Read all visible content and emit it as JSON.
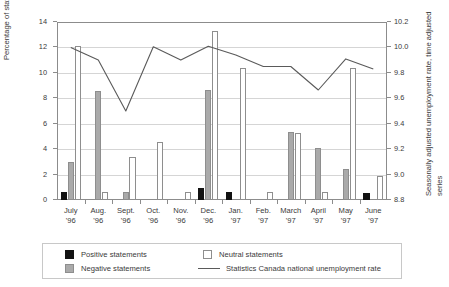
{
  "chart_data": {
    "type": "bar",
    "title": "",
    "xlabel": "",
    "ylabel": "Percentage of statements about unemployment",
    "y2label": "Seasonally adjusted unemployment rate, time adjusted series",
    "ylim": [
      0,
      14
    ],
    "y2lim": [
      8.8,
      10.2
    ],
    "grid": true,
    "legend_position": "bottom",
    "categories": [
      "July\n'96",
      "Aug.\n'96",
      "Sept.\n'96",
      "Oct.\n'96",
      "Nov.\n'96",
      "Dec.\n'96",
      "Jan.\n'97",
      "Feb.\n'97",
      "March\n'97",
      "April\n'97",
      "May\n'97",
      "June\n'97"
    ],
    "category_labels": [
      {
        "month": "July",
        "year": "'96"
      },
      {
        "month": "Aug.",
        "year": "'96"
      },
      {
        "month": "Sept.",
        "year": "'96"
      },
      {
        "month": "Oct.",
        "year": "'96"
      },
      {
        "month": "Nov.",
        "year": "'96"
      },
      {
        "month": "Dec.",
        "year": "'96"
      },
      {
        "month": "Jan.",
        "year": "'97"
      },
      {
        "month": "Feb.",
        "year": "'97"
      },
      {
        "month": "March",
        "year": "'97"
      },
      {
        "month": "April",
        "year": "'97"
      },
      {
        "month": "May",
        "year": "'97"
      },
      {
        "month": "June",
        "year": "'97"
      }
    ],
    "ytick_labels": [
      "0",
      "2",
      "4",
      "6",
      "8",
      "10",
      "12",
      "14"
    ],
    "ytick_values": [
      0,
      2,
      4,
      6,
      8,
      10,
      12,
      14
    ],
    "y2tick_labels": [
      "8.8",
      "9.0",
      "9.2",
      "9.4",
      "9.6",
      "9.8",
      "10.0",
      "10.2"
    ],
    "y2tick_values": [
      8.8,
      9.0,
      9.2,
      9.4,
      9.6,
      9.8,
      10.0,
      10.2
    ],
    "series": [
      {
        "name": "Positive statements",
        "kind": "bar",
        "color": "#121212",
        "axis": "left",
        "values": [
          0.6,
          0,
          0,
          0,
          0,
          0.95,
          0.6,
          0,
          0,
          0,
          0,
          0.55
        ]
      },
      {
        "name": "Negative statements",
        "kind": "bar",
        "color": "#aaaaaa",
        "axis": "left",
        "values": [
          3.0,
          8.6,
          0.65,
          0,
          0,
          8.65,
          0,
          0,
          5.35,
          4.1,
          2.45,
          0
        ]
      },
      {
        "name": "Neutral statements",
        "kind": "bar",
        "color": "#ffffff",
        "axis": "left",
        "values": [
          12.1,
          0.65,
          3.4,
          4.6,
          0.65,
          13.3,
          10.4,
          0.65,
          5.3,
          0.6,
          10.4,
          1.9
        ]
      },
      {
        "name": "Statistics Canada national unemployment rate",
        "kind": "line",
        "color": "#5a5a5a",
        "axis": "right",
        "values": [
          10.0,
          9.9,
          9.5,
          10.0,
          9.9,
          10.0,
          9.8,
          9.7,
          9.7,
          9.55,
          9.75,
          9.74
        ],
        "values_left_scale": [
          12.0,
          11.0,
          7.0,
          12.05,
          11.0,
          12.1,
          11.4,
          10.5,
          10.5,
          8.65,
          11.1,
          10.3
        ]
      }
    ]
  },
  "legend": {
    "entries": [
      {
        "label": "Positive statements",
        "swatch": "positive-swatch"
      },
      {
        "label": "Neutral statements",
        "swatch": "neutral-swatch"
      },
      {
        "label": "Negative statements",
        "swatch": "negative-swatch"
      },
      {
        "label": "Statistics Canada national unemployment rate",
        "swatch": "line-swatch"
      }
    ]
  }
}
